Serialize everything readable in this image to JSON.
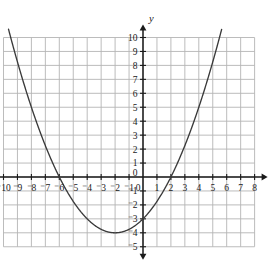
{
  "chart_data": {
    "type": "line",
    "title": "",
    "subtitle": "",
    "xlabel": "x",
    "ylabel": "y",
    "xlim": [
      -10,
      8
    ],
    "ylim": [
      -5,
      10
    ],
    "grid": true,
    "legend": "none",
    "x_tick_labels": [
      "⁻10",
      "⁻9",
      "⁻8",
      "⁻7",
      "⁻6",
      "⁻5",
      "⁻4",
      "⁻3",
      "⁻2",
      "⁻1",
      "0",
      "1",
      "2",
      "3",
      "4",
      "5",
      "6",
      "7",
      "8"
    ],
    "x_tick_values": [
      -10,
      -9,
      -8,
      -7,
      -6,
      -5,
      -4,
      -3,
      -2,
      -1,
      0,
      1,
      2,
      3,
      4,
      5,
      6,
      7,
      8
    ],
    "y_tick_labels": [
      "10",
      "9",
      "8",
      "7",
      "6",
      "5",
      "4",
      "3",
      "2",
      "1",
      "0",
      "⁻1",
      "⁻2",
      "⁻3",
      "⁻4",
      "⁻5"
    ],
    "y_tick_values": [
      10,
      9,
      8,
      7,
      6,
      5,
      4,
      3,
      2,
      1,
      0,
      -1,
      -2,
      -3,
      -4,
      -5
    ],
    "series": [
      {
        "name": "parabola",
        "equation": "y = 0.25x^2 + x - 3",
        "form_factored": "y = 0.25(x + 6)(x - 2)",
        "vertex": [
          -2,
          -4
        ],
        "roots": [
          -6,
          2
        ],
        "y_intercept": -3,
        "a": 0.25,
        "b": 1,
        "c": -3,
        "color": "#3a3a3a",
        "x": [
          -10,
          -9.5,
          -9,
          -8.5,
          -8,
          -7.5,
          -7,
          -6.5,
          -6,
          -5.5,
          -5,
          -4.5,
          -4,
          -3.5,
          -3,
          -2.5,
          -2,
          -1.5,
          -1,
          -0.5,
          0,
          0.5,
          1,
          1.5,
          2,
          2.5,
          3,
          3.5,
          4,
          4.5,
          5,
          5.5,
          6
        ],
        "values": [
          12,
          9.5625,
          9,
          6.5625,
          5,
          3.5625,
          2.25,
          1.0625,
          0,
          -0.9375,
          -1.75,
          -2.4375,
          -3,
          -3.4375,
          -3.75,
          -3.9375,
          -4,
          -3.9375,
          -3.75,
          -3.4375,
          -3,
          -2.4375,
          -1.75,
          -0.9375,
          0,
          1.0625,
          2.25,
          3.5625,
          5,
          6.5625,
          8.25,
          10.0625,
          12
        ]
      }
    ],
    "colors": {
      "grid": "#b4b4b4",
      "axis": "#1a1a1a",
      "curve": "#3a3a3a",
      "tick_text": "#1a1a1a",
      "background": "#ffffff"
    }
  },
  "axes": {
    "x_axis_name": "x-axis",
    "y_axis_name": "y-axis",
    "x_label": "x",
    "y_label": "y"
  }
}
